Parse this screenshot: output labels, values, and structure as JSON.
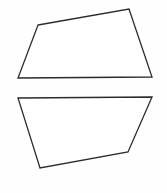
{
  "figure": {
    "canvas": {
      "width": 167,
      "height": 193,
      "background_color": "#fefefe"
    },
    "style": {
      "stroke_color": "#2b2b2b",
      "fill_color": "#ffffff",
      "stroke_width": 1.3
    },
    "shapes": [
      {
        "name": "top-quadrilateral",
        "sides": 4,
        "label": "Top quadrilateral",
        "points": "38,25 129,9 152,77 18,78",
        "vertices": [
          {
            "x": 38,
            "y": 25,
            "name": "upper-left"
          },
          {
            "x": 129,
            "y": 9,
            "name": "upper-right"
          },
          {
            "x": 152,
            "y": 77,
            "name": "lower-right"
          },
          {
            "x": 18,
            "y": 78,
            "name": "lower-left"
          }
        ]
      },
      {
        "name": "bottom-pentagon",
        "sides": 5,
        "label": "Bottom pentagon",
        "points": "18,98 152,97 128,152 40,168 18,98",
        "vertices": [
          {
            "x": 18,
            "y": 98,
            "name": "upper-left"
          },
          {
            "x": 152,
            "y": 97,
            "name": "upper-right"
          },
          {
            "x": 128,
            "y": 152,
            "name": "right-kink"
          },
          {
            "x": 40,
            "y": 168,
            "name": "lower-left"
          }
        ]
      }
    ]
  }
}
